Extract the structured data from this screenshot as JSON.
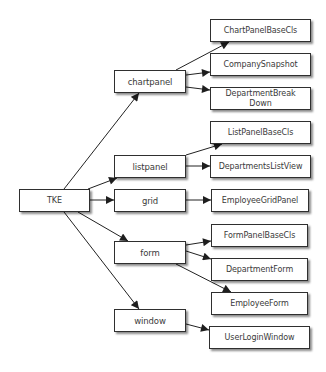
{
  "diagram": {
    "type": "tree",
    "root": "TKE",
    "nodes": [
      {
        "id": "tke",
        "label": "TKE",
        "x": 19,
        "y": 189,
        "w": 71,
        "h": 23,
        "level": 0
      },
      {
        "id": "chartpanel",
        "label": "chartpanel",
        "x": 114,
        "y": 70,
        "w": 72,
        "h": 23,
        "level": 1
      },
      {
        "id": "listpanel",
        "label": "listpanel",
        "x": 114,
        "y": 155,
        "w": 72,
        "h": 23,
        "level": 1
      },
      {
        "id": "grid",
        "label": "grid",
        "x": 114,
        "y": 189,
        "w": 72,
        "h": 23,
        "level": 1
      },
      {
        "id": "form",
        "label": "form",
        "x": 114,
        "y": 241,
        "w": 72,
        "h": 23,
        "level": 1
      },
      {
        "id": "window",
        "label": "window",
        "x": 114,
        "y": 309,
        "w": 72,
        "h": 23,
        "level": 1
      },
      {
        "id": "chartpanelbasecls",
        "label": "ChartPanelBaseCls",
        "x": 210,
        "y": 19,
        "w": 101,
        "h": 23,
        "level": 2
      },
      {
        "id": "companysnapshot",
        "label": "CompanySnapshot",
        "x": 210,
        "y": 53,
        "w": 101,
        "h": 23,
        "level": 2
      },
      {
        "id": "departmentbreakdown",
        "label": "DepartmentBreak\nDown",
        "x": 210,
        "y": 87,
        "w": 101,
        "h": 23,
        "level": 2
      },
      {
        "id": "listpanelbasecls",
        "label": "ListPanelBaseCls",
        "x": 210,
        "y": 121,
        "w": 101,
        "h": 23,
        "level": 2
      },
      {
        "id": "departmentslistview",
        "label": "DepartmentsListView",
        "x": 210,
        "y": 155,
        "w": 101,
        "h": 23,
        "level": 2
      },
      {
        "id": "employeegridpanel",
        "label": "EmployeeGridPanel",
        "x": 211,
        "y": 189,
        "w": 98,
        "h": 23,
        "level": 2
      },
      {
        "id": "formpanelbasecls",
        "label": "FormPanelBaseCls",
        "x": 211,
        "y": 224,
        "w": 97,
        "h": 23,
        "level": 2
      },
      {
        "id": "departmentform",
        "label": "DepartmentForm",
        "x": 211,
        "y": 258,
        "w": 97,
        "h": 23,
        "level": 2
      },
      {
        "id": "employeeform",
        "label": "EmployeeForm",
        "x": 211,
        "y": 292,
        "w": 97,
        "h": 23,
        "level": 2
      },
      {
        "id": "userloginwindow",
        "label": "UserLoginWindow",
        "x": 209,
        "y": 326,
        "w": 101,
        "h": 23,
        "level": 2
      }
    ],
    "edges": [
      {
        "from": "tke",
        "to": "chartpanel",
        "x1": 64,
        "y1": 189,
        "x2": 139,
        "y2": 93
      },
      {
        "from": "tke",
        "to": "listpanel",
        "x1": 88,
        "y1": 189,
        "x2": 117,
        "y2": 178
      },
      {
        "from": "tke",
        "to": "grid",
        "x1": 90,
        "y1": 200,
        "x2": 114,
        "y2": 200
      },
      {
        "from": "tke",
        "to": "form",
        "x1": 78,
        "y1": 212,
        "x2": 128,
        "y2": 241
      },
      {
        "from": "tke",
        "to": "window",
        "x1": 64,
        "y1": 212,
        "x2": 139,
        "y2": 309
      },
      {
        "from": "chartpanel",
        "to": "chartpanelbasecls",
        "x1": 176,
        "y1": 70,
        "x2": 229,
        "y2": 42
      },
      {
        "from": "chartpanel",
        "to": "companysnapshot",
        "x1": 186,
        "y1": 75,
        "x2": 210,
        "y2": 72
      },
      {
        "from": "chartpanel",
        "to": "departmentbreakdown",
        "x1": 186,
        "y1": 87,
        "x2": 210,
        "y2": 90
      },
      {
        "from": "listpanel",
        "to": "listpanelbasecls",
        "x1": 186,
        "y1": 155,
        "x2": 222,
        "y2": 144
      },
      {
        "from": "listpanel",
        "to": "departmentslistview",
        "x1": 186,
        "y1": 166,
        "x2": 210,
        "y2": 166
      },
      {
        "from": "grid",
        "to": "employeegridpanel",
        "x1": 186,
        "y1": 200,
        "x2": 211,
        "y2": 200
      },
      {
        "from": "form",
        "to": "formpanelbasecls",
        "x1": 186,
        "y1": 245,
        "x2": 211,
        "y2": 241
      },
      {
        "from": "form",
        "to": "departmentform",
        "x1": 186,
        "y1": 251,
        "x2": 211,
        "y2": 259
      },
      {
        "from": "form",
        "to": "employeeform",
        "x1": 176,
        "y1": 264,
        "x2": 231,
        "y2": 292
      },
      {
        "from": "window",
        "to": "userloginwindow",
        "x1": 186,
        "y1": 324,
        "x2": 209,
        "y2": 330
      }
    ]
  },
  "colors": {
    "background": "#ffffff",
    "node_fill": "#ffffff",
    "node_border": "#2f2f2f",
    "text": "#3a3a3a",
    "edge": "#222222"
  }
}
